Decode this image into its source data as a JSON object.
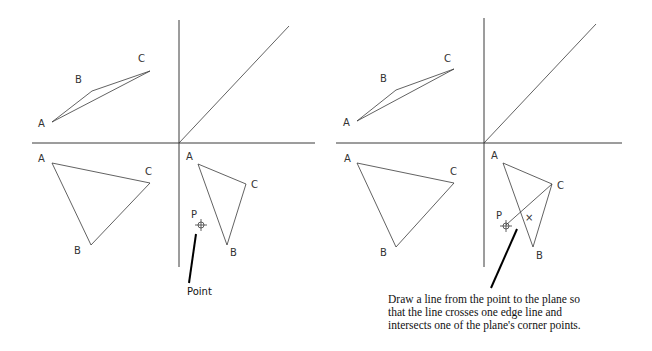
{
  "panels": [
    {
      "id": "left",
      "front_view": {
        "labels": {
          "A": "A",
          "B": "B",
          "C": "C"
        }
      },
      "top_view": {
        "labels": {
          "A": "A",
          "B": "B",
          "C": "C"
        }
      },
      "side_view": {
        "labels": {
          "A": "A",
          "B": "B",
          "C": "C"
        },
        "point_label": "P"
      },
      "callout": "Point"
    },
    {
      "id": "right",
      "front_view": {
        "labels": {
          "A": "A",
          "B": "B",
          "C": "C"
        }
      },
      "top_view": {
        "labels": {
          "A": "A",
          "B": "B",
          "C": "C"
        }
      },
      "side_view": {
        "labels": {
          "A": "A",
          "B": "B",
          "C": "C"
        },
        "point_label": "P",
        "intersection_mark": "×"
      },
      "callout_lines": [
        "Draw a line from the point to the plane so",
        "that the line crosses one edge line and",
        "intersects one of the plane's corner points."
      ]
    }
  ]
}
